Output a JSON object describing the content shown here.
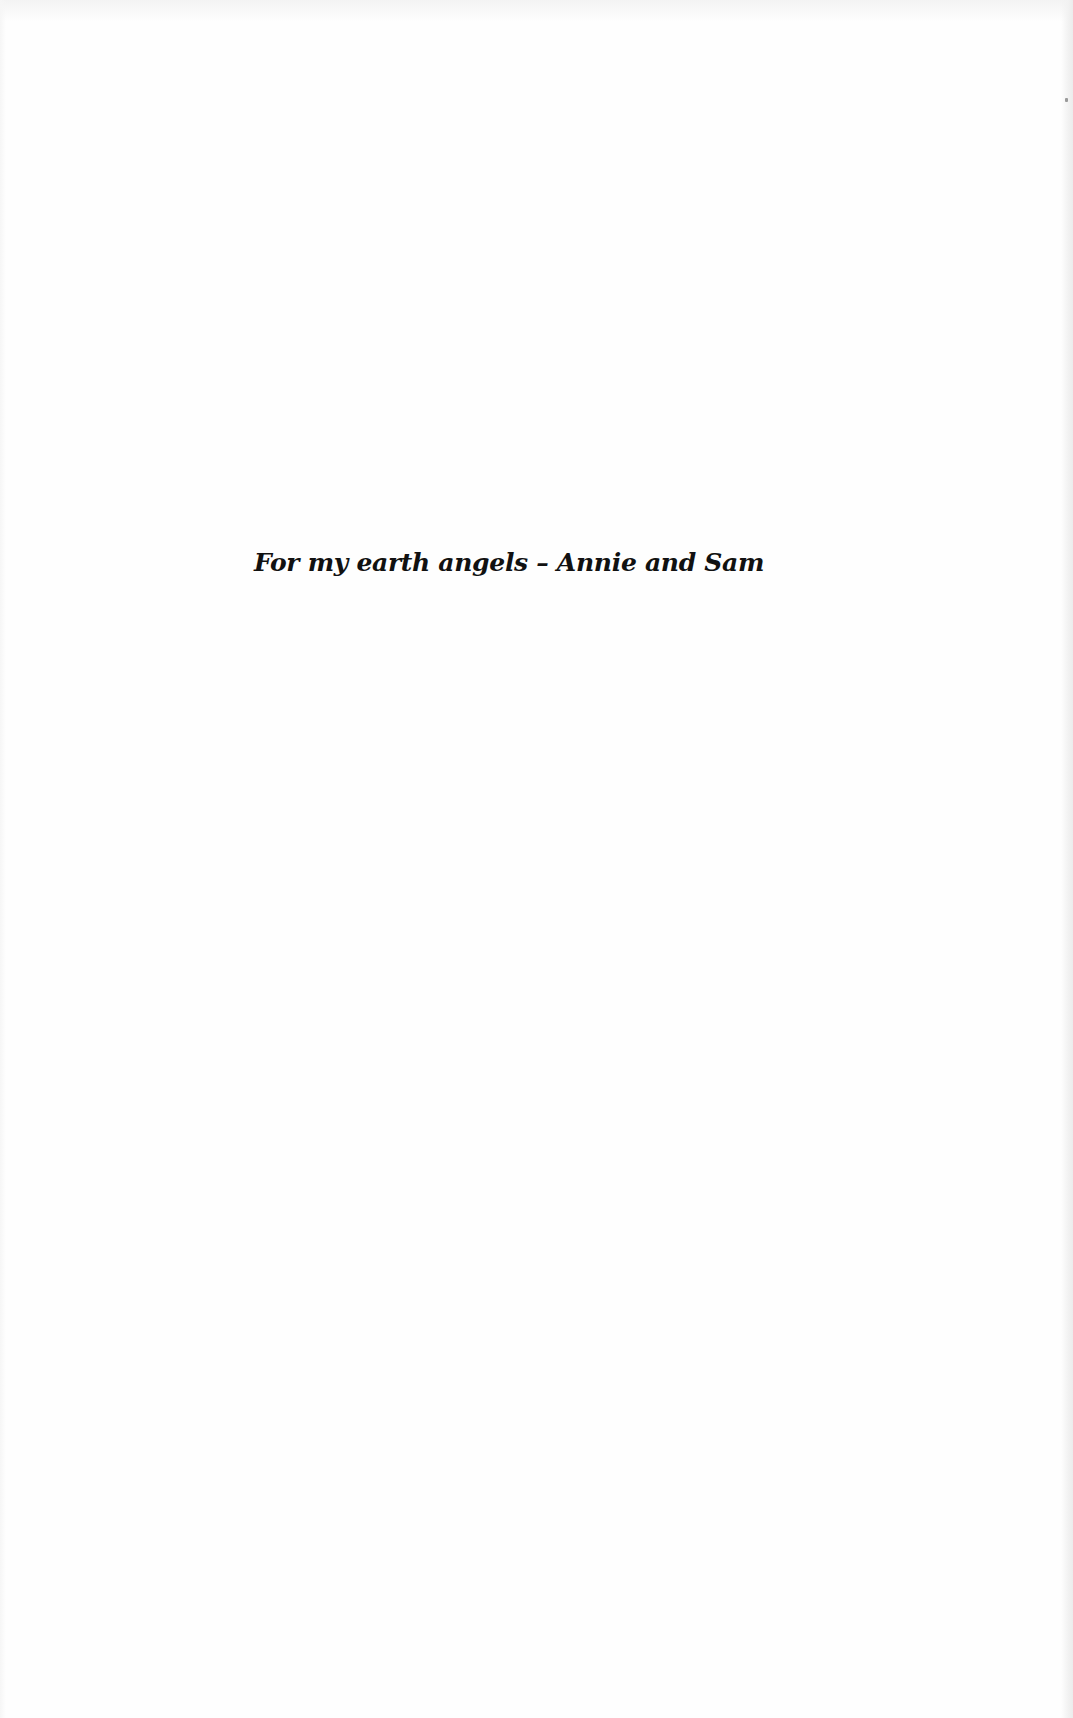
{
  "page": {
    "type": "dedication",
    "background_color": "#fefefe",
    "text_color": "#111111"
  },
  "dedication": {
    "text": "For my earth angels – Annie and Sam"
  }
}
